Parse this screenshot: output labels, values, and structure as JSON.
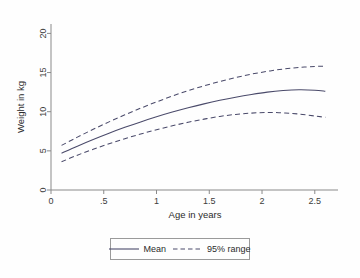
{
  "chart_data": {
    "type": "line",
    "title": "",
    "xlabel": "Age in years",
    "ylabel": "Weight in kg",
    "xlim": [
      0,
      2.72
    ],
    "ylim": [
      0,
      21.2
    ],
    "xticks": [
      "0",
      ".5",
      "1",
      "1.5",
      "2",
      "2.5"
    ],
    "xtick_values": [
      0,
      0.5,
      1,
      1.5,
      2,
      2.5
    ],
    "yticks": [
      "0",
      "5",
      "10",
      "15",
      "20"
    ],
    "ytick_values": [
      0,
      5,
      10,
      15,
      20
    ],
    "grid": false,
    "legend_position": "below-axis",
    "x": [
      0.1,
      0.25,
      0.4,
      0.55,
      0.7,
      0.85,
      1.0,
      1.15,
      1.3,
      1.45,
      1.6,
      1.75,
      1.9,
      2.05,
      2.2,
      2.35,
      2.5,
      2.6
    ],
    "series": [
      {
        "name": "Mean",
        "style": "solid",
        "color": "#4a4a6a",
        "values": [
          4.7,
          5.6,
          6.45,
          7.25,
          8.0,
          8.7,
          9.35,
          9.95,
          10.5,
          11.0,
          11.45,
          11.85,
          12.2,
          12.5,
          12.7,
          12.8,
          12.75,
          12.62
        ]
      },
      {
        "name": "95% range upper",
        "style": "dashed",
        "color": "#4a4a6a",
        "values": [
          5.7,
          6.75,
          7.75,
          8.7,
          9.6,
          10.45,
          11.25,
          12.0,
          12.7,
          13.3,
          13.85,
          14.35,
          14.8,
          15.15,
          15.45,
          15.65,
          15.78,
          15.82
        ]
      },
      {
        "name": "95% range lower",
        "style": "dashed",
        "color": "#4a4a6a",
        "values": [
          3.6,
          4.45,
          5.2,
          5.9,
          6.55,
          7.15,
          7.7,
          8.2,
          8.65,
          9.05,
          9.4,
          9.65,
          9.82,
          9.9,
          9.85,
          9.7,
          9.45,
          9.28
        ]
      }
    ],
    "legend": [
      {
        "label": "Mean",
        "style": "solid"
      },
      {
        "label": "95% range",
        "style": "dashed"
      }
    ]
  },
  "colors": {
    "line": "#4a4a6a",
    "axis": "#8a8a8a",
    "text": "#2b2b2b",
    "background": "#fefefe"
  }
}
